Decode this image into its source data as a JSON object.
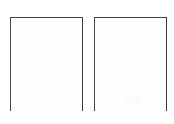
{
  "canvas": {
    "width_px": 174,
    "height_px": 124,
    "background_color": "#ffffff",
    "description": "Two blank rectangular page outlines side by side on a white background"
  },
  "pages": [
    {
      "id": "page-left",
      "label": "Left blank page",
      "content_text": "",
      "x_px": 10,
      "y_px": 17,
      "width_px": 73,
      "height_px": 94,
      "border_color": "#3f4147",
      "fill_color": "#ffffff",
      "has_content": false
    },
    {
      "id": "page-right",
      "label": "Right blank page",
      "content_text": "",
      "x_px": 94,
      "y_px": 17,
      "width_px": 73,
      "height_px": 94,
      "border_color": "#3f4147",
      "fill_color": "#ffffff",
      "has_content": false,
      "artifact": {
        "name": "scan-smudge",
        "color": "#fafafa",
        "x_px": 30,
        "y_px": 79,
        "width_px": 16,
        "height_px": 7
      }
    }
  ]
}
